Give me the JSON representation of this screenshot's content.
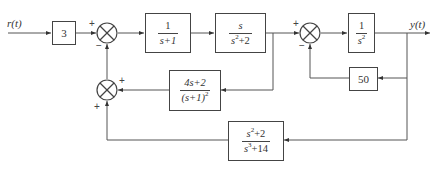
{
  "diagram": {
    "input_label": "r(t)",
    "output_label": "y(t)",
    "blocks": {
      "gain_input": {
        "text": "3"
      },
      "g1": {
        "num": "1",
        "den": "s+1"
      },
      "g2": {
        "num": "s",
        "den_base": "s",
        "den_exp": "2",
        "den_rest": "+2"
      },
      "g3": {
        "num": "1",
        "den_base": "s",
        "den_exp": "2"
      },
      "h_inner": {
        "text": "50"
      },
      "h_mid": {
        "num": "4s+2",
        "den_base": "(s+1)",
        "den_exp": "2"
      },
      "h_outer": {
        "num_base": "s",
        "num_exp": "2",
        "num_rest": "+2",
        "den_base": "s",
        "den_exp": "3",
        "den_rest": "+14"
      }
    },
    "summing_junctions": {
      "sum1": {
        "top_left_sign": "+",
        "bottom_sign": "−"
      },
      "sum2": {
        "right_sign": "+",
        "bottom_sign": "+"
      },
      "sum3": {
        "top_left_sign": "+",
        "bottom_sign": "−"
      }
    },
    "colors": {
      "line": "#444444",
      "text": "#333333",
      "background": "#ffffff"
    }
  }
}
